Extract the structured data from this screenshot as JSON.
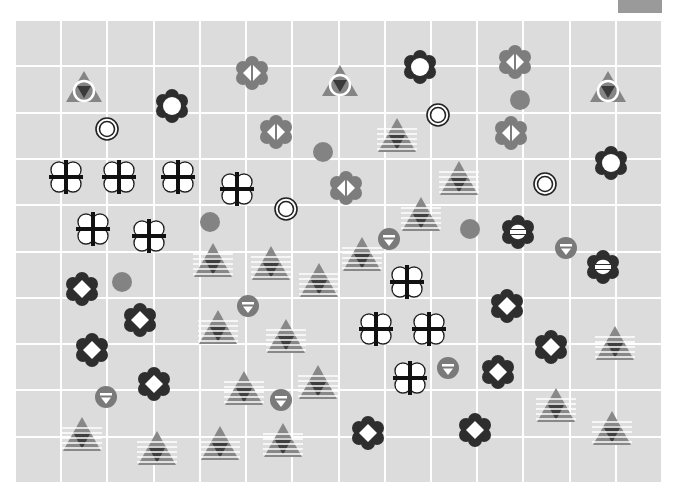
{
  "board": {
    "columns": 14,
    "rows": 10,
    "colors": {
      "background": "#dcdcdc",
      "grid_line": "#ffffff",
      "dark": "#333333",
      "mid_gray": "#808080",
      "light_gray": "#9a9a9a",
      "white": "#ffffff"
    }
  },
  "pieces": [
    {
      "type": "triangle-ring",
      "x": 84,
      "y": 88
    },
    {
      "type": "triangle-ring",
      "x": 340,
      "y": 82
    },
    {
      "type": "triangle-ring",
      "x": 608,
      "y": 88
    },
    {
      "type": "flower-dot",
      "x": 172,
      "y": 106
    },
    {
      "type": "flower-dot",
      "x": 420,
      "y": 67
    },
    {
      "type": "flower-dot",
      "x": 611,
      "y": 163
    },
    {
      "type": "gray-flower-split",
      "x": 252,
      "y": 73
    },
    {
      "type": "gray-flower-split",
      "x": 515,
      "y": 62
    },
    {
      "type": "gray-flower-split",
      "x": 276,
      "y": 132
    },
    {
      "type": "gray-flower-split",
      "x": 511,
      "y": 133
    },
    {
      "type": "gray-flower-split",
      "x": 346,
      "y": 188
    },
    {
      "type": "target",
      "x": 107,
      "y": 129
    },
    {
      "type": "target",
      "x": 438,
      "y": 115
    },
    {
      "type": "target",
      "x": 286,
      "y": 209
    },
    {
      "type": "target",
      "x": 545,
      "y": 184
    },
    {
      "type": "gray-dot",
      "x": 520,
      "y": 100
    },
    {
      "type": "gray-dot",
      "x": 323,
      "y": 152
    },
    {
      "type": "gray-dot",
      "x": 210,
      "y": 222
    },
    {
      "type": "gray-dot",
      "x": 470,
      "y": 229
    },
    {
      "type": "gray-dot",
      "x": 122,
      "y": 282
    },
    {
      "type": "striped-triangle",
      "x": 397,
      "y": 135
    },
    {
      "type": "striped-triangle",
      "x": 459,
      "y": 178
    },
    {
      "type": "striped-triangle",
      "x": 421,
      "y": 214
    },
    {
      "type": "striped-triangle",
      "x": 213,
      "y": 260
    },
    {
      "type": "striped-triangle",
      "x": 271,
      "y": 263
    },
    {
      "type": "striped-triangle",
      "x": 362,
      "y": 254
    },
    {
      "type": "striped-triangle",
      "x": 319,
      "y": 280
    },
    {
      "type": "striped-triangle",
      "x": 218,
      "y": 327
    },
    {
      "type": "striped-triangle",
      "x": 286,
      "y": 336
    },
    {
      "type": "striped-triangle",
      "x": 615,
      "y": 343
    },
    {
      "type": "striped-triangle",
      "x": 244,
      "y": 388
    },
    {
      "type": "striped-triangle",
      "x": 318,
      "y": 382
    },
    {
      "type": "striped-triangle",
      "x": 82,
      "y": 434
    },
    {
      "type": "striped-triangle",
      "x": 157,
      "y": 448
    },
    {
      "type": "striped-triangle",
      "x": 220,
      "y": 443
    },
    {
      "type": "striped-triangle",
      "x": 283,
      "y": 440
    },
    {
      "type": "striped-triangle",
      "x": 556,
      "y": 405
    },
    {
      "type": "striped-triangle",
      "x": 612,
      "y": 428
    },
    {
      "type": "clover-cross",
      "x": 66,
      "y": 177
    },
    {
      "type": "clover-cross",
      "x": 119,
      "y": 177
    },
    {
      "type": "clover-cross",
      "x": 178,
      "y": 177
    },
    {
      "type": "clover-cross",
      "x": 237,
      "y": 189
    },
    {
      "type": "clover-cross",
      "x": 93,
      "y": 229
    },
    {
      "type": "clover-cross",
      "x": 149,
      "y": 236
    },
    {
      "type": "clover-cross",
      "x": 407,
      "y": 282
    },
    {
      "type": "clover-cross",
      "x": 376,
      "y": 329
    },
    {
      "type": "clover-cross",
      "x": 429,
      "y": 329
    },
    {
      "type": "clover-cross",
      "x": 410,
      "y": 378
    },
    {
      "type": "small-badge",
      "x": 389,
      "y": 239
    },
    {
      "type": "small-badge",
      "x": 566,
      "y": 248
    },
    {
      "type": "small-badge",
      "x": 248,
      "y": 306
    },
    {
      "type": "small-badge",
      "x": 106,
      "y": 397
    },
    {
      "type": "small-badge",
      "x": 281,
      "y": 400
    },
    {
      "type": "small-badge",
      "x": 448,
      "y": 368
    },
    {
      "type": "flower-bar",
      "x": 518,
      "y": 232
    },
    {
      "type": "flower-bar",
      "x": 603,
      "y": 267
    },
    {
      "type": "flower-diamond",
      "x": 82,
      "y": 289
    },
    {
      "type": "flower-diamond",
      "x": 140,
      "y": 320
    },
    {
      "type": "flower-diamond",
      "x": 92,
      "y": 350
    },
    {
      "type": "flower-diamond",
      "x": 154,
      "y": 384
    },
    {
      "type": "flower-diamond",
      "x": 507,
      "y": 306
    },
    {
      "type": "flower-diamond",
      "x": 551,
      "y": 347
    },
    {
      "type": "flower-diamond",
      "x": 498,
      "y": 372
    },
    {
      "type": "flower-diamond",
      "x": 368,
      "y": 433
    },
    {
      "type": "flower-diamond",
      "x": 475,
      "y": 430
    }
  ]
}
